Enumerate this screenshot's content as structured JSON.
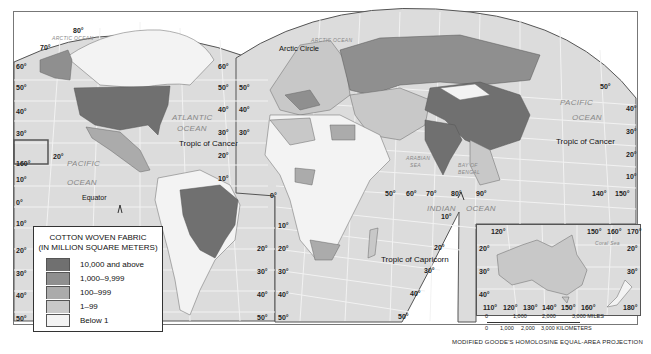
{
  "map": {
    "title": "Cotton Woven Fabric Production",
    "colors": {
      "ocean": "#dcdcdc",
      "grid": "#f2f2f2",
      "level_5": "#707070",
      "level_4": "#8f8f8f",
      "level_3": "#ababab",
      "level_2": "#c8c8c8",
      "level_1": "#f3f3f3"
    },
    "oceans": {
      "arctic_left": "ARCTIC OCEAN",
      "arctic_right": "ARCTIC OCEAN",
      "atlantic_1": "ATLANTIC",
      "atlantic_2": "OCEAN",
      "pacific_left_1": "PACIFIC",
      "pacific_left_2": "OCEAN",
      "pacific_right_1": "PACIFIC",
      "pacific_right_2": "OCEAN",
      "indian_1": "INDIAN",
      "indian_2": "OCEAN",
      "arabian_1": "ARABIAN",
      "arabian_2": "SEA",
      "bengal_1": "BAY OF",
      "bengal_2": "BENGAL",
      "coral": "Coral Sea"
    },
    "lines": {
      "arctic_circle": "Arctic Circle",
      "tropic_cancer_left": "Tropic of Cancer",
      "tropic_cancer_right": "Tropic of Cancer",
      "equator": "Equator",
      "tropic_capricorn": "Tropic of Capricorn"
    },
    "lat_left": [
      "80°",
      "70°",
      "60°",
      "50°",
      "40°",
      "30°",
      "20°",
      "10°",
      "0°",
      "10°",
      "20°",
      "30°",
      "40°",
      "50°"
    ],
    "lat_labels": {
      "l80": "80°",
      "l70": "70°",
      "l60": "60°",
      "l50": "50°",
      "l40": "40°",
      "l30": "30°",
      "l160": "160°",
      "l20": "20°",
      "l10": "10°",
      "l0": "0°",
      "s10": "10°",
      "s20": "20°",
      "s30": "30°",
      "s40": "40°",
      "s50": "50°"
    },
    "mid_labels": {
      "n60": "60°",
      "n50": "50°",
      "n40": "40°",
      "n30": "30°",
      "n20": "20°",
      "n10": "10°",
      "e50": "50°",
      "e40": "40°",
      "e30": "30°",
      "e0": "0°",
      "sa20": "20°",
      "sa30": "30°",
      "sa40": "40°",
      "sa50": "50°",
      "af10": "10°",
      "af20": "20°",
      "af30": "30°",
      "af40": "40°",
      "af50": "50°"
    },
    "east_labels": {
      "lon50": "50°",
      "lon60": "60°",
      "lon70": "70°",
      "lon80": "80°",
      "lon90": "90°",
      "lon140": "140°",
      "lon150": "150°",
      "r50": "50°",
      "r40": "40°",
      "r30": "30°",
      "r20": "20°",
      "r10": "10°",
      "i10": "10°",
      "i20": "20°",
      "i30": "30°",
      "i40": "40°",
      "i50": "50°"
    }
  },
  "legend": {
    "title_1": "COTTON WOVEN FABRIC",
    "title_2": "(IN MILLION SQUARE METERS)",
    "items": [
      {
        "label": "10,000 and above",
        "color": "#707070"
      },
      {
        "label": "1,000–9,999",
        "color": "#8f8f8f"
      },
      {
        "label": "100–999",
        "color": "#ababab"
      },
      {
        "label": "1–99",
        "color": "#c8c8c8"
      },
      {
        "label": "Below 1",
        "color": "#f3f3f3"
      }
    ]
  },
  "inset": {
    "top_labels": [
      "120°",
      "150°",
      "160°",
      "170°"
    ],
    "left_labels": [
      "20°",
      "30°",
      "40°"
    ],
    "right_labels": [
      "20°",
      "30°"
    ],
    "bottom_labels": [
      "110°",
      "120°",
      "130°",
      "140°",
      "150°",
      "160°",
      "180°"
    ],
    "coral_sea": "Coral Sea"
  },
  "scale": {
    "miles": [
      "0",
      "1,000",
      "2,000",
      "3,000 MILES"
    ],
    "km": [
      "0",
      "1,000",
      "2,000",
      "3,000 KILOMETERS"
    ]
  },
  "projection": "MODIFIED GOODE'S HOMOLOSINE EQUAL-AREA PROJECTION"
}
